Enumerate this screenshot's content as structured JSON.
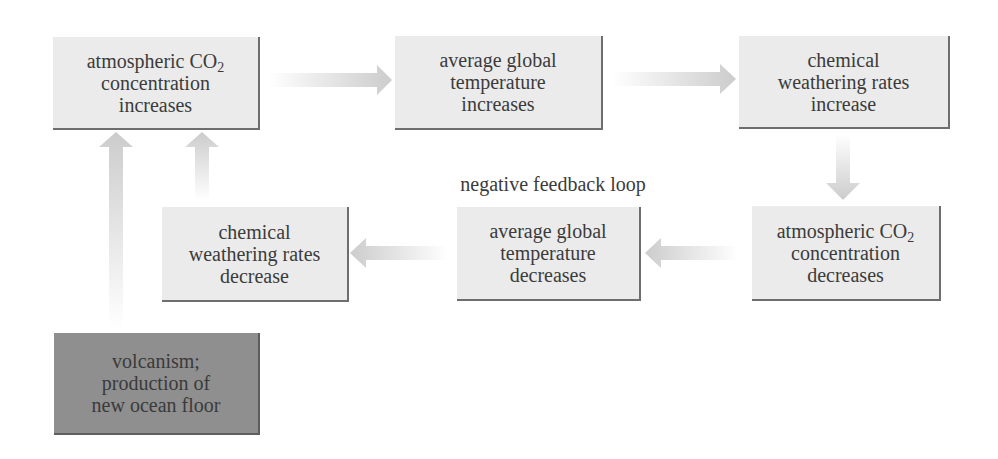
{
  "diagram": {
    "title_label": "negative feedback loop",
    "nodes": [
      {
        "id": "co2-increases",
        "lines": [
          "atmospheric CO",
          "concentration",
          "increases"
        ],
        "subscript": "2"
      },
      {
        "id": "temp-increases",
        "lines": [
          "average global",
          "temperature",
          "increases"
        ]
      },
      {
        "id": "weathering-increase",
        "lines": [
          "chemical",
          "weathering rates",
          "increase"
        ]
      },
      {
        "id": "co2-decreases",
        "lines": [
          "atmospheric CO",
          "concentration",
          "decreases"
        ],
        "subscript": "2"
      },
      {
        "id": "temp-decreases",
        "lines": [
          "average global",
          "temperature",
          "decreases"
        ]
      },
      {
        "id": "weathering-decrease",
        "lines": [
          "chemical",
          "weathering rates",
          "decrease"
        ]
      },
      {
        "id": "volcanism",
        "lines": [
          "volcanism;",
          "production of",
          "new ocean floor"
        ]
      }
    ],
    "edges": [
      {
        "from": "co2-increases",
        "to": "temp-increases",
        "direction": "right"
      },
      {
        "from": "temp-increases",
        "to": "weathering-increase",
        "direction": "right"
      },
      {
        "from": "weathering-increase",
        "to": "co2-decreases",
        "direction": "down"
      },
      {
        "from": "co2-decreases",
        "to": "temp-decreases",
        "direction": "left"
      },
      {
        "from": "temp-decreases",
        "to": "weathering-decrease",
        "direction": "left"
      },
      {
        "from": "weathering-decrease",
        "to": "co2-increases",
        "direction": "up"
      },
      {
        "from": "volcanism",
        "to": "co2-increases",
        "direction": "up"
      }
    ],
    "colors": {
      "box_fill": "#ebebeb",
      "box_dark_fill": "#8f8f8f",
      "box_shadow": "#6e6e6e",
      "arrow": "#cfcfcf",
      "text": "#3b3b3b"
    }
  }
}
